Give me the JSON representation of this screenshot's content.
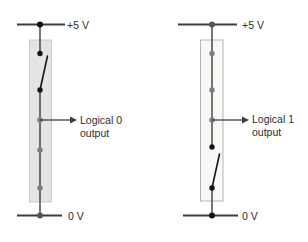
{
  "figure": {
    "colors": {
      "bg": "#ffffff",
      "wire": "#3d3d3d",
      "dot_black": "#141414",
      "dot_gray": "#7d7d7d",
      "dot_mid": "#565656",
      "box_left_fill": "#e5e4e2",
      "box_left_border": "#c2c1bc",
      "box_right_fill": "#f8f8f6",
      "box_right_border": "#a3a39e",
      "text": "#2e2e2e"
    },
    "circuits": [
      {
        "name": "logical-0",
        "supply_label": "+5 V",
        "ground_label": "0 V",
        "output_line1": "Logical 0",
        "output_line2": "output",
        "top_switch": "open",
        "bottom_switch": "closed"
      },
      {
        "name": "logical-1",
        "supply_label": "+5 V",
        "ground_label": "0 V",
        "output_line1": "Logical 1",
        "output_line2": "output",
        "top_switch": "closed",
        "bottom_switch": "open"
      }
    ]
  }
}
